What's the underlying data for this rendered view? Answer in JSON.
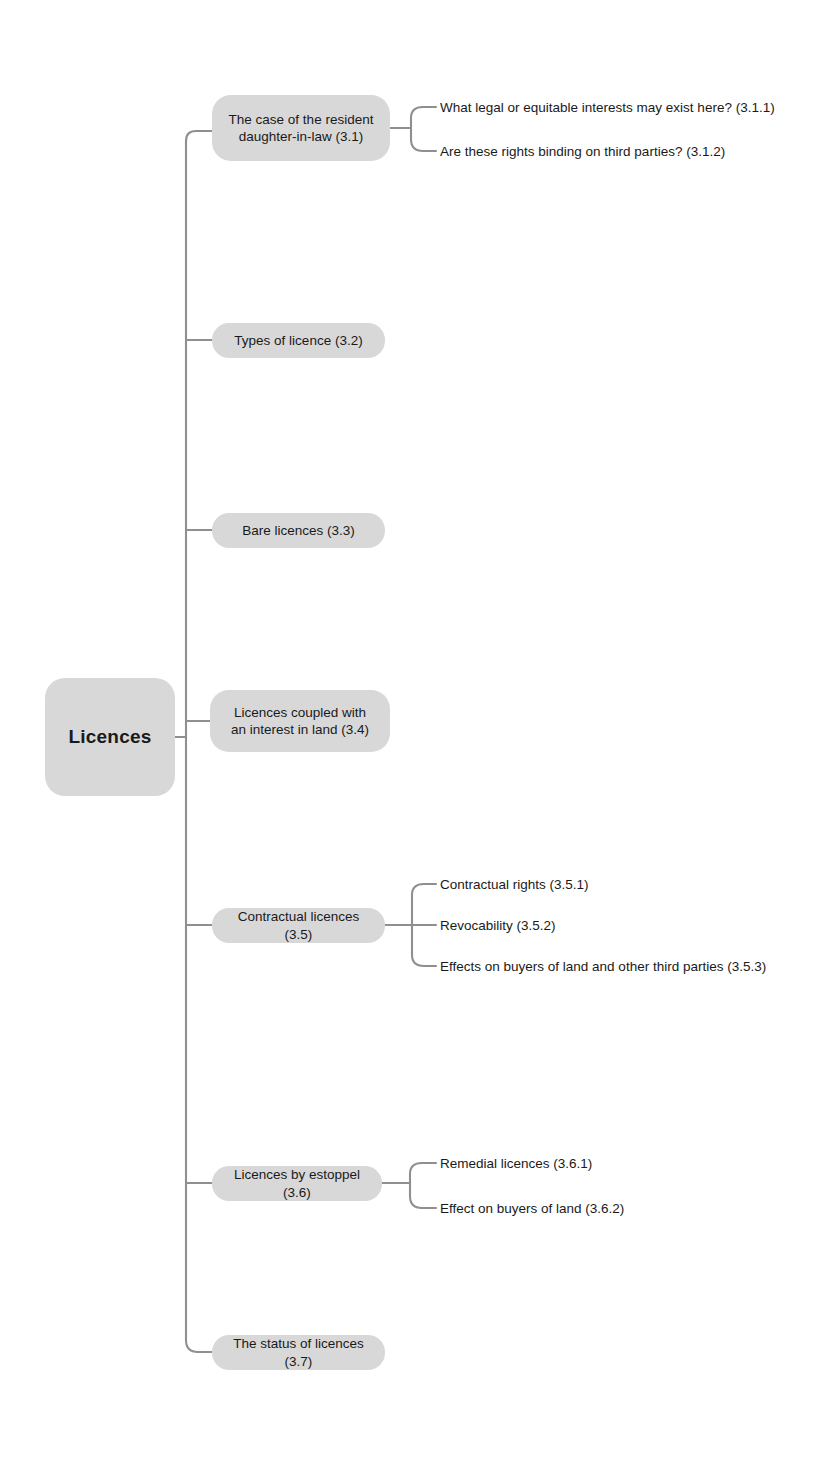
{
  "diagram": {
    "type": "mind-map",
    "root": {
      "label": "Licences"
    },
    "branches": [
      {
        "id": "3.1",
        "label": "The case of the resident daughter-in-law (3.1)",
        "line1": "The case of the resident",
        "line2": "daughter-in-law (3.1)",
        "children": [
          {
            "id": "3.1.1",
            "label": "What legal or equitable interests may exist here? (3.1.1)"
          },
          {
            "id": "3.1.2",
            "label": "Are these rights binding on third parties? (3.1.2)"
          }
        ]
      },
      {
        "id": "3.2",
        "label": "Types of licence (3.2)",
        "children": []
      },
      {
        "id": "3.3",
        "label": "Bare licences (3.3)",
        "children": []
      },
      {
        "id": "3.4",
        "label": "Licences coupled with an interest in land (3.4)",
        "line1": "Licences coupled with",
        "line2": "an interest in land (3.4)",
        "children": []
      },
      {
        "id": "3.5",
        "label": "Contractual licences (3.5)",
        "children": [
          {
            "id": "3.5.1",
            "label": "Contractual rights (3.5.1)"
          },
          {
            "id": "3.5.2",
            "label": "Revocability (3.5.2)"
          },
          {
            "id": "3.5.3",
            "label": "Effects on buyers of land and other third parties (3.5.3)"
          }
        ]
      },
      {
        "id": "3.6",
        "label": "Licences by estoppel (3.6)",
        "children": [
          {
            "id": "3.6.1",
            "label": "Remedial licences (3.6.1)"
          },
          {
            "id": "3.6.2",
            "label": "Effect on buyers of land (3.6.2)"
          }
        ]
      },
      {
        "id": "3.7",
        "label": "The status of licences (3.7)",
        "children": []
      }
    ],
    "colors": {
      "node_fill": "#d8d8d8",
      "connector": "#8f8f8f",
      "text": "#1a1a1a",
      "background": "#ffffff"
    }
  }
}
